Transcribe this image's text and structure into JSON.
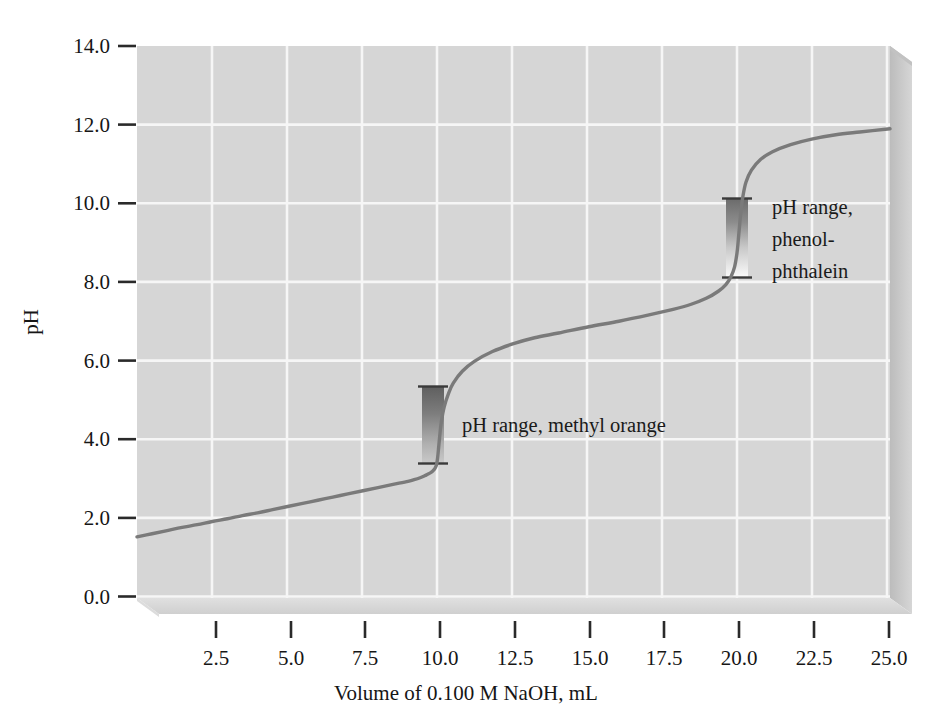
{
  "chart_data": {
    "type": "line",
    "title": "",
    "subtitle": "",
    "xlabel": "Volume of 0.100 M NaOH, mL",
    "ylabel": "pH",
    "xlim": [
      0.0,
      25.0
    ],
    "ylim": [
      0.0,
      14.0
    ],
    "grid": true,
    "legend_position": "none",
    "xticks": [
      "2.5",
      "5.0",
      "7.5",
      "10.0",
      "12.5",
      "15.0",
      "17.5",
      "20.0",
      "22.5",
      "25.0"
    ],
    "xtick_values": [
      2.5,
      5.0,
      7.5,
      10.0,
      12.5,
      15.0,
      17.5,
      20.0,
      22.5,
      25.0
    ],
    "yticks": [
      "0.0",
      "2.0",
      "4.0",
      "6.0",
      "8.0",
      "10.0",
      "12.0",
      "14.0"
    ],
    "ytick_values": [
      0.0,
      2.0,
      4.0,
      6.0,
      8.0,
      10.0,
      12.0,
      14.0
    ],
    "series": [
      {
        "name": "Titration curve",
        "color": "#7a7a7a",
        "x": [
          0.0,
          0.5,
          1.0,
          1.5,
          2.0,
          2.5,
          3.0,
          3.5,
          4.0,
          4.5,
          5.0,
          5.5,
          6.0,
          6.5,
          7.0,
          7.5,
          8.0,
          8.5,
          9.0,
          9.2,
          9.4,
          9.55,
          9.65,
          9.75,
          9.82,
          9.88,
          9.92,
          9.95,
          9.98,
          10.0,
          10.05,
          10.1,
          10.2,
          10.35,
          10.5,
          10.8,
          11.2,
          11.8,
          12.5,
          13.2,
          14.0,
          15.0,
          16.0,
          17.0,
          17.8,
          18.4,
          18.9,
          19.3,
          19.55,
          19.72,
          19.84,
          19.92,
          19.96,
          20.0,
          20.05,
          20.12,
          20.22,
          20.4,
          20.7,
          21.1,
          21.7,
          22.4,
          23.2,
          24.0,
          25.0
        ],
        "y": [
          1.55,
          1.63,
          1.71,
          1.79,
          1.86,
          1.94,
          2.01,
          2.09,
          2.16,
          2.24,
          2.32,
          2.4,
          2.48,
          2.56,
          2.64,
          2.72,
          2.8,
          2.88,
          2.96,
          3.0,
          3.05,
          3.1,
          3.14,
          3.18,
          3.22,
          3.27,
          3.33,
          3.4,
          3.55,
          3.7,
          4.1,
          4.45,
          4.85,
          5.2,
          5.45,
          5.75,
          6.0,
          6.25,
          6.45,
          6.6,
          6.72,
          6.88,
          7.02,
          7.18,
          7.32,
          7.45,
          7.6,
          7.78,
          7.95,
          8.15,
          8.4,
          8.75,
          9.05,
          9.4,
          9.8,
          10.2,
          10.55,
          10.85,
          11.12,
          11.32,
          11.5,
          11.64,
          11.75,
          11.82,
          11.9
        ]
      }
    ],
    "annotations": [
      {
        "id": "methyl-orange-band",
        "label_lines": [
          "pH range, methyl orange"
        ],
        "x_center": 10.0,
        "ph_low": 3.3,
        "ph_high": 5.2,
        "color_top": "#6e6e6e",
        "color_bottom": "#c4c4c4"
      },
      {
        "id": "phenolphthalein-band",
        "label_lines": [
          "pH range,",
          "phenol-",
          "phthalein"
        ],
        "x_center": 20.0,
        "ph_low": 8.0,
        "ph_high": 10.0,
        "color_top": "#717171",
        "color_bottom": "#f2f2f2"
      }
    ],
    "plot_background": "#d4d4d4",
    "gridline_color": "#f5f5f5"
  },
  "figure": {
    "axis_x_title": "Volume of 0.100 M NaOH, mL",
    "axis_y_title": "pH",
    "x_tick_labels": [
      "2.5",
      "5.0",
      "7.5",
      "10.0",
      "12.5",
      "15.0",
      "17.5",
      "20.0",
      "22.5",
      "25.0"
    ],
    "y_tick_labels": [
      "14.0",
      "12.0",
      "10.0",
      "8.0",
      "6.0",
      "4.0",
      "2.0",
      "0.0"
    ],
    "annotation_methyl_orange": "pH range, methyl orange",
    "annotation_phenolphthalein_line1": "pH range,",
    "annotation_phenolphthalein_line2": "phenol-",
    "annotation_phenolphthalein_line3": "phthalein"
  }
}
